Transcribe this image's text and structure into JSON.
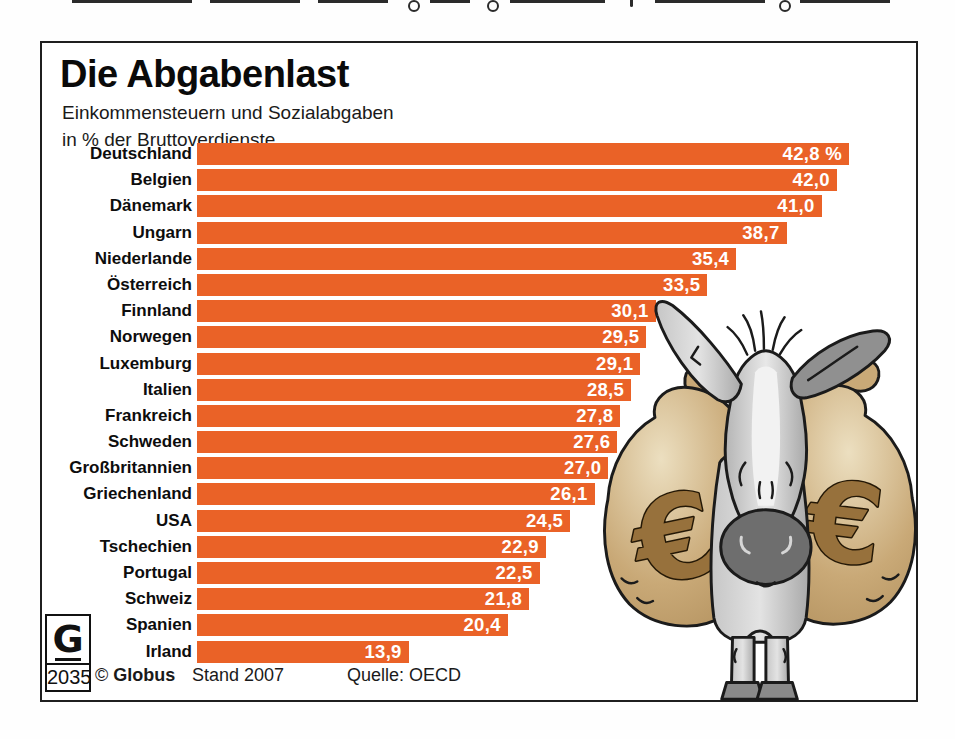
{
  "header": {
    "title": "Die Abgabenlast",
    "subtitle_line1": "Einkommensteuern und Sozialabgaben",
    "subtitle_line2": "in % der Bruttoverdienste"
  },
  "chart_data": {
    "type": "bar",
    "orientation": "horizontal",
    "title": "Die Abgabenlast",
    "subtitle": "Einkommensteuern und Sozialabgaben in % der Bruttoverdienste",
    "unit": "%",
    "xlim": [
      0,
      43
    ],
    "grid": false,
    "legend": false,
    "bar_color": "#EA6227",
    "value_label_color": "#FFFFFF",
    "categories": [
      "Deutschland",
      "Belgien",
      "Dänemark",
      "Ungarn",
      "Niederlande",
      "Österreich",
      "Finnland",
      "Norwegen",
      "Luxemburg",
      "Italien",
      "Frankreich",
      "Schweden",
      "Großbritannien",
      "Griechenland",
      "USA",
      "Tschechien",
      "Portugal",
      "Schweiz",
      "Spanien",
      "Irland"
    ],
    "values": [
      42.8,
      42.0,
      41.0,
      38.7,
      35.4,
      33.5,
      30.1,
      29.5,
      29.1,
      28.5,
      27.8,
      27.6,
      27.0,
      26.1,
      24.5,
      22.9,
      22.5,
      21.8,
      20.4,
      13.9
    ],
    "value_labels": [
      "42,8 %",
      "42,0",
      "41,0",
      "38,7",
      "35,4",
      "33,5",
      "30,1",
      "29,5",
      "29,1",
      "28,5",
      "27,8",
      "27,6",
      "27,0",
      "26,1",
      "24,5",
      "22,9",
      "22,5",
      "21,8",
      "20,4",
      "13,9"
    ]
  },
  "footer": {
    "logo_letter": "G",
    "logo_number": "2035",
    "copyright": "© ",
    "brand": "Globus",
    "stand": "Stand 2007",
    "source": "Quelle: OECD"
  },
  "illustration": {
    "name": "donkey-carrying-euro-moneybags",
    "currency_symbol": "€",
    "bag_color": "#C4A471",
    "euro_color": "#97713C",
    "donkey_color": "#C2C2C2"
  }
}
